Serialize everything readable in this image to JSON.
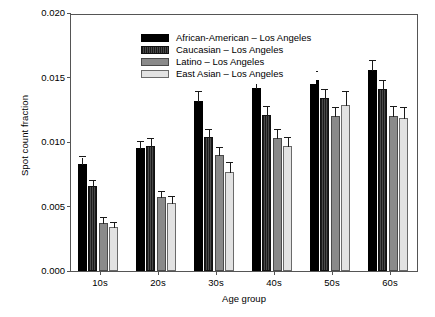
{
  "chart_data": {
    "type": "bar",
    "title": "",
    "xlabel": "Age group",
    "ylabel": "Spot count fraction",
    "categories": [
      "10s",
      "20s",
      "30s",
      "40s",
      "50s",
      "60s"
    ],
    "ylim": [
      0.0,
      0.02
    ],
    "yticks": [
      "0.000",
      "0.005",
      "0.010",
      "0.015",
      "0.020"
    ],
    "ytick_values": [
      0.0,
      0.005,
      0.01,
      0.015,
      0.02
    ],
    "grid": false,
    "legend_position": "top-left",
    "series": [
      {
        "name": "African-American – Los Angeles",
        "color": "#000000",
        "values": [
          0.0083,
          0.0095,
          0.0132,
          0.0142,
          0.0148,
          0.0156
        ],
        "errors": [
          0.0005,
          0.0005,
          0.0007,
          0.0006,
          0.0006,
          0.0007
        ]
      },
      {
        "name": "Caucasian – Los Angeles",
        "color": "#2e2e2e",
        "values": [
          0.0066,
          0.0097,
          0.0104,
          0.0121,
          0.0134,
          0.0141
        ],
        "errors": [
          0.0004,
          0.0005,
          0.0005,
          0.0006,
          0.0006,
          0.0006
        ]
      },
      {
        "name": "Latino – Los Angeles",
        "color": "#8a8a8a",
        "values": [
          0.0037,
          0.0057,
          0.009,
          0.0103,
          0.012,
          0.012
        ],
        "errors": [
          0.0004,
          0.0004,
          0.0005,
          0.0006,
          0.0006,
          0.0007
        ]
      },
      {
        "name": "East Asian – Los Angeles",
        "color": "#e2e2e2",
        "values": [
          0.0034,
          0.0053,
          0.0077,
          0.0097,
          0.0129,
          0.0119
        ],
        "errors": [
          0.0003,
          0.0004,
          0.0007,
          0.0006,
          0.001,
          0.0007
        ]
      }
    ]
  }
}
